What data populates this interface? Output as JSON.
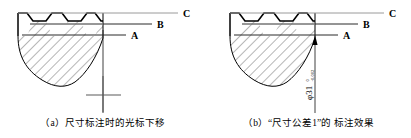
{
  "figure": {
    "width": 411,
    "height": 138,
    "background": "#ffffff",
    "line_color": "#000000",
    "hatch_color": "#4a4a4a",
    "leader_color": "#8c8c8c"
  },
  "panels": [
    {
      "id": "a",
      "caption": "（a）尺寸标注时的光标下移",
      "leaders": [
        {
          "label": "C",
          "y": 13
        },
        {
          "label": "B",
          "y": 24
        },
        {
          "label": "A",
          "y": 35
        }
      ],
      "cursor": {
        "name": "crosshair-cursor",
        "x": 135,
        "y": 95
      },
      "dimension_line": {
        "x": 103,
        "y_top": 36,
        "y_bottom": 113
      }
    },
    {
      "id": "b",
      "caption": "（b）“尺寸公差1”的 标注效果",
      "leaders": [
        {
          "label": "C",
          "y": 13
        },
        {
          "label": "B",
          "y": 24
        },
        {
          "label": "A",
          "y": 35
        }
      ],
      "dimension": {
        "symbol": "φ",
        "nominal": "31",
        "upper_tolerance": "0",
        "lower_tolerance": "-0.002",
        "full_text": "φ31 0/-0.002",
        "rotation": -90,
        "x": 108,
        "y_top": 38,
        "y_bottom": 113
      }
    }
  ]
}
